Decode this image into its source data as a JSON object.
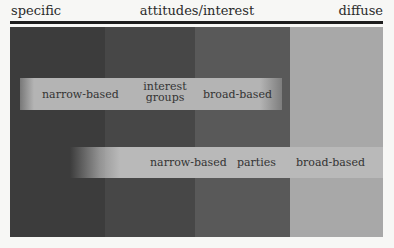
{
  "header": {
    "left_label": "specific",
    "center_label": "attitudes/interest",
    "right_label": "diffuse"
  },
  "bands": [
    {
      "name": "band-1",
      "left": 0,
      "width": 95,
      "color": "#3d3d3d"
    },
    {
      "name": "band-2",
      "left": 95,
      "width": 90,
      "color": "#474747"
    },
    {
      "name": "band-3",
      "left": 185,
      "width": 95,
      "color": "#5a5a5a"
    },
    {
      "name": "band-4",
      "left": 280,
      "width": 93,
      "color": "#a9a9a9"
    }
  ],
  "bars": [
    {
      "name": "interest-groups",
      "labels": {
        "narrow": "narrow-based",
        "center": "interest groups",
        "broad": "broad-based"
      },
      "fill": "#b4b4b4"
    },
    {
      "name": "parties",
      "labels": {
        "narrow": "narrow-based",
        "center": "parties",
        "broad": "broad-based"
      },
      "fill": "#b9b9b9"
    }
  ]
}
